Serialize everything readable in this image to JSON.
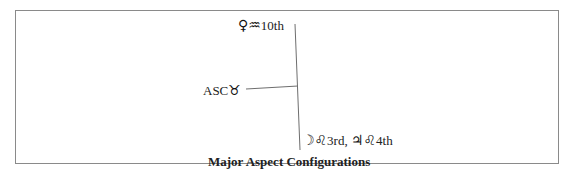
{
  "diagram": {
    "title": "Major Aspect Configurations",
    "nodes": [
      {
        "id": "venus",
        "glyphs": "♀♒",
        "label": "10th",
        "planet": "Venus",
        "sign": "Aquarius"
      },
      {
        "id": "asc",
        "prefix": "ASC",
        "glyphs": "♉",
        "label": "",
        "sign": "Taurus"
      },
      {
        "id": "moon-jupiter",
        "glyphs1": "☽♌",
        "label1": "3rd,",
        "glyphs2": "♃♌",
        "label2": "4th"
      }
    ],
    "edges": [
      {
        "from": "venus",
        "to": "moon-jupiter",
        "type": "vertical-line"
      },
      {
        "from": "asc",
        "to": "venus-moon-line",
        "type": "horizontal-line"
      }
    ],
    "line_color": "#6e6e6e",
    "frame_color": "#8a8a8a"
  }
}
